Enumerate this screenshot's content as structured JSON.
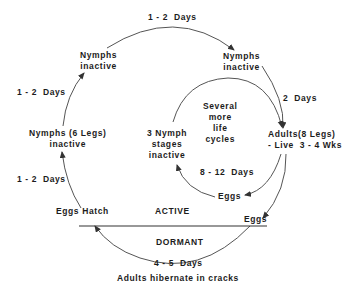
{
  "diagram": {
    "colors": {
      "line": "#444444",
      "text": "#1c1c1c",
      "background": "#ffffff"
    },
    "nodes": {
      "nymphs_top_left": "Nymphs\ninactive",
      "nymphs_top_right": "Nymphs\ninactive",
      "nymphs_6legs": "Nymphs (6 Legs)\ninactive",
      "adults": "Adults(8 Legs)\n- Live  3 - 4 Wks",
      "three_nymph": "3 Nymph\nstages\ninactive",
      "several_cycles": "Several\nmore\nlife\ncycles",
      "eggs_inner": "Eggs",
      "eggs_outer": "Eggs",
      "eggs_hatch": "Eggs Hatch"
    },
    "durations": {
      "top": "1 - 2  Days",
      "left_upper": "1 - 2  Days",
      "left_lower": "1 - 2  Days",
      "right": "2  Days",
      "inner": "8 - 12  Days",
      "dormant": "4 - 5  Days"
    },
    "zones": {
      "active": "ACTIVE",
      "dormant": "DORMANT"
    },
    "caption": "Adults hibernate in cracks"
  }
}
